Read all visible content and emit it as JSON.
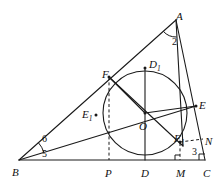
{
  "figure": {
    "kind": "geometry-diagram",
    "stroke_color": "#1a1a1a",
    "background_color": "#ffffff",
    "canvas": {
      "width": 224,
      "height": 187
    }
  },
  "points": {
    "A": {
      "label": "A",
      "sub": "",
      "x": 176,
      "y": 20,
      "lx": 176,
      "ly": 11
    },
    "B": {
      "label": "B",
      "sub": "",
      "x": 19,
      "y": 160,
      "lx": 12,
      "ly": 167
    },
    "C": {
      "label": "C",
      "sub": "",
      "x": 205,
      "y": 160,
      "lx": 203,
      "ly": 168
    },
    "O": {
      "label": "O",
      "sub": "",
      "x": 145,
      "y": 113,
      "lx": 139,
      "ly": 121
    },
    "D": {
      "label": "D",
      "sub": "",
      "x": 145,
      "y": 160,
      "lx": 141,
      "ly": 168
    },
    "D1": {
      "label": "D",
      "sub": "1",
      "x": 145,
      "y": 68,
      "lx": 149,
      "ly": 59
    },
    "E": {
      "label": "E",
      "sub": "",
      "x": 196,
      "y": 106,
      "lx": 199,
      "ly": 100
    },
    "E1": {
      "label": "E",
      "sub": "1",
      "x": 96,
      "y": 115,
      "lx": 82,
      "ly": 109
    },
    "F": {
      "label": "F",
      "sub": "",
      "x": 109,
      "y": 77,
      "lx": 102,
      "ly": 69
    },
    "F1": {
      "label": "F",
      "sub": "1",
      "x": 180,
      "y": 142,
      "lx": 174,
      "ly": 133
    },
    "M": {
      "label": "M",
      "sub": "",
      "x": 180,
      "y": 160,
      "lx": 176,
      "ly": 168
    },
    "N": {
      "label": "N",
      "sub": "",
      "x": 203,
      "y": 139,
      "lx": 205,
      "ly": 136
    },
    "P": {
      "label": "P",
      "sub": "",
      "x": 109,
      "y": 160,
      "lx": 105,
      "ly": 168
    }
  },
  "circle": {
    "name": "incircle",
    "center_x": 145,
    "center_y": 113,
    "radius": 42
  },
  "angles": [
    {
      "name": "angle-2-at-A",
      "label": "2",
      "lx": 172,
      "ly": 37
    },
    {
      "name": "angle-3-at-C",
      "label": "3",
      "lx": 192,
      "ly": 147
    },
    {
      "name": "angle-5-at-B",
      "label": "5",
      "lx": 42,
      "ly": 149
    },
    {
      "name": "angle-6-at-B",
      "label": "6",
      "lx": 42,
      "ly": 134
    }
  ],
  "segments": {
    "solid": [
      {
        "name": "side-AB",
        "x1": 176,
        "y1": 20,
        "x2": 19,
        "y2": 160
      },
      {
        "name": "side-BC",
        "x1": 19,
        "y1": 160,
        "x2": 205,
        "y2": 160
      },
      {
        "name": "side-CA",
        "x1": 205,
        "y1": 160,
        "x2": 176,
        "y2": 20
      },
      {
        "name": "cevian-A-to-F1",
        "x1": 176,
        "y1": 20,
        "x2": 183,
        "y2": 146
      },
      {
        "name": "cevian-B-to-E",
        "x1": 19,
        "y1": 160,
        "x2": 196,
        "y2": 106
      },
      {
        "name": "diameter-D1-D",
        "x1": 145,
        "y1": 68,
        "x2": 145,
        "y2": 160
      },
      {
        "name": "chord-F-to-F1",
        "x1": 109,
        "y1": 77,
        "x2": 183,
        "y2": 146
      },
      {
        "name": "radius-O-to-F",
        "x1": 145,
        "y1": 113,
        "x2": 109,
        "y2": 77
      },
      {
        "name": "radius-O-to-E",
        "x1": 145,
        "y1": 113,
        "x2": 196,
        "y2": 106
      }
    ],
    "dashed": [
      {
        "name": "perpendicular-F-to-P",
        "x1": 109,
        "y1": 77,
        "x2": 109,
        "y2": 160
      },
      {
        "name": "perpendicular-F1-to-M",
        "x1": 180,
        "y1": 143,
        "x2": 180,
        "y2": 160
      },
      {
        "name": "horizontal-F1-to-N",
        "x1": 180,
        "y1": 142,
        "x2": 203,
        "y2": 139
      }
    ]
  },
  "marks": {
    "angle_arc_at_A": {
      "name": "angle-arc-A",
      "cx": 176,
      "cy": 20,
      "r": 17
    },
    "angle_arc_at_B": {
      "name": "angle-arc-B",
      "cx": 19,
      "cy": 160,
      "r": 26
    },
    "right_angle_at_M": {
      "name": "right-angle-mark-M",
      "x": 180,
      "y": 160
    },
    "right_angle_at_C": {
      "name": "right-angle-mark-C",
      "x": 205,
      "y": 160
    }
  }
}
